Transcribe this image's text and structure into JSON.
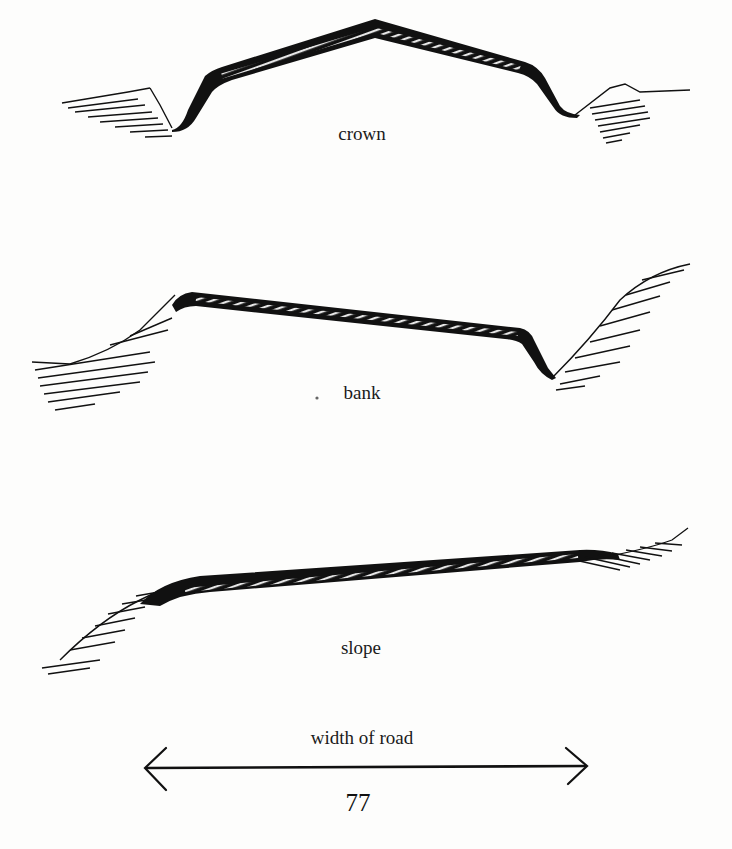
{
  "figure": {
    "profiles": [
      {
        "id": "crown",
        "label": "crown"
      },
      {
        "id": "bank",
        "label": "bank"
      },
      {
        "id": "slope",
        "label": "slope"
      }
    ],
    "width_indicator": {
      "label": "width of road"
    },
    "page_number": "77"
  }
}
